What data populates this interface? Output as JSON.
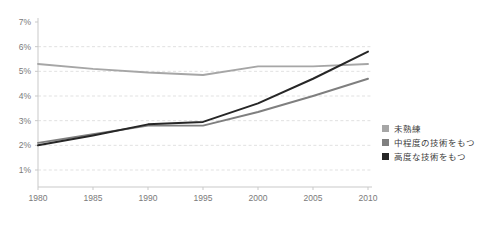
{
  "chart_data": {
    "type": "line",
    "title": "",
    "xlabel": "",
    "ylabel": "",
    "x": [
      1980,
      1985,
      1990,
      1995,
      2000,
      2005,
      2010
    ],
    "categories": [
      "1980",
      "1985",
      "1990",
      "1995",
      "2000",
      "2005",
      "2010"
    ],
    "xlim": [
      1980,
      2010
    ],
    "ylim": [
      0,
      7
    ],
    "ytick_labels": [
      "1%",
      "2%",
      "3%",
      "4%",
      "5%",
      "6%",
      "7%"
    ],
    "ytick_values": [
      1,
      2,
      3,
      4,
      5,
      6,
      7
    ],
    "grid": "horizontal-dashed",
    "legend_position": "right",
    "series": [
      {
        "name": "未熟練",
        "color": "#a6a6a6",
        "values": [
          5.3,
          5.1,
          4.95,
          4.85,
          5.2,
          5.2,
          5.3
        ]
      },
      {
        "name": "中程度の技術をもつ",
        "color": "#7f7f7f",
        "values": [
          2.1,
          2.45,
          2.8,
          2.8,
          3.35,
          4.0,
          4.7
        ]
      },
      {
        "name": "高度な技術をもつ",
        "color": "#262626",
        "values": [
          2.0,
          2.4,
          2.85,
          2.95,
          3.7,
          4.7,
          5.8
        ]
      }
    ]
  },
  "legend": {
    "items": [
      {
        "label": "未熟練",
        "color": "#a6a6a6"
      },
      {
        "label": "中程度の技術をもつ",
        "color": "#7f7f7f"
      },
      {
        "label": "高度な技術をもつ",
        "color": "#262626"
      }
    ]
  },
  "axes": {
    "y_labels": [
      "7%",
      "6%",
      "5%",
      "4%",
      "3%",
      "2%",
      "1%"
    ],
    "x_labels": [
      "1980",
      "1985",
      "1990",
      "1995",
      "2000",
      "2005",
      "2010"
    ]
  },
  "colors": {
    "grid": "#d9d9d9",
    "axis": "#c9c9c9",
    "tick_text": "#7a7a7a",
    "legend_text": "#3d3d3d",
    "background": "#ffffff"
  }
}
